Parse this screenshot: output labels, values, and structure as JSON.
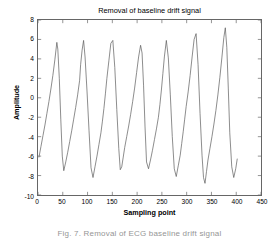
{
  "figure": {
    "background_color": "#ffffff",
    "axis_color": "#666666",
    "line_color": "#5a5a5a"
  },
  "caption": {
    "text": "Fig. 7.  Removal of ECG baseline drift signal"
  },
  "chart_data": {
    "type": "line",
    "title": "Removal of baseline drift signal",
    "xlabel": "Sampling point",
    "ylabel": "Amplitude",
    "xlim": [
      0,
      450
    ],
    "ylim": [
      -10,
      8
    ],
    "xticks": [
      0,
      50,
      100,
      150,
      200,
      250,
      300,
      350,
      400,
      450
    ],
    "yticks": [
      -10,
      -8,
      -6,
      -4,
      -2,
      0,
      2,
      4,
      6,
      8
    ],
    "grid": false,
    "legend": null,
    "series": [
      {
        "name": "ECG after baseline drift removal",
        "color": "#5a5a5a",
        "x": [
          2,
          6,
          10,
          14,
          18,
          22,
          26,
          30,
          34,
          38,
          40,
          43,
          46,
          49,
          52,
          56,
          60,
          64,
          68,
          72,
          76,
          80,
          84,
          86,
          89,
          92,
          95,
          99,
          103,
          107,
          111,
          115,
          119,
          123,
          127,
          130,
          133,
          136,
          139,
          143,
          147,
          151,
          155,
          159,
          163,
          166,
          169,
          172,
          175,
          179,
          183,
          187,
          191,
          195,
          199,
          203,
          207,
          210,
          213,
          216,
          219,
          223,
          227,
          231,
          235,
          239,
          243,
          246,
          249,
          252,
          255,
          259,
          263,
          267,
          271,
          275,
          279,
          283,
          287,
          290,
          293,
          296,
          299,
          303,
          307,
          311,
          315,
          319,
          323,
          327,
          331,
          334,
          337,
          340,
          343,
          347,
          351,
          355,
          359,
          363,
          367,
          371,
          375,
          378,
          381,
          384,
          387,
          391,
          395,
          399,
          402
        ],
        "y": [
          -6.1,
          -5.0,
          -3.9,
          -2.8,
          -1.6,
          -0.4,
          0.9,
          2.3,
          3.9,
          5.7,
          5.0,
          2.0,
          -2.2,
          -6.0,
          -7.5,
          -6.6,
          -5.6,
          -4.5,
          -3.4,
          -2.2,
          -1.0,
          0.3,
          1.8,
          3.4,
          4.9,
          5.9,
          4.2,
          0.6,
          -3.4,
          -7.2,
          -8.2,
          -7.1,
          -6.0,
          -4.8,
          -3.6,
          -2.4,
          -1.1,
          0.4,
          2.0,
          3.8,
          5.6,
          5.9,
          3.1,
          -1.2,
          -5.2,
          -7.4,
          -7.1,
          -6.1,
          -5.1,
          -4.0,
          -2.9,
          -1.7,
          -0.4,
          1.0,
          2.6,
          4.2,
          5.4,
          4.6,
          1.3,
          -3.0,
          -6.6,
          -7.3,
          -6.4,
          -5.4,
          -4.3,
          -3.2,
          -2.0,
          -0.7,
          0.8,
          2.5,
          4.2,
          5.9,
          4.1,
          0.3,
          -4.0,
          -7.3,
          -8.1,
          -7.0,
          -5.9,
          -4.7,
          -3.5,
          -2.2,
          -0.9,
          0.6,
          2.3,
          4.2,
          6.0,
          6.6,
          3.4,
          -1.6,
          -5.9,
          -8.2,
          -8.8,
          -7.6,
          -6.4,
          -5.2,
          -4.0,
          -2.7,
          -1.3,
          0.3,
          2.1,
          4.1,
          6.2,
          7.2,
          5.2,
          1.0,
          -3.6,
          -7.1,
          -8.2,
          -7.3,
          -6.3
        ]
      }
    ],
    "annotations": []
  }
}
